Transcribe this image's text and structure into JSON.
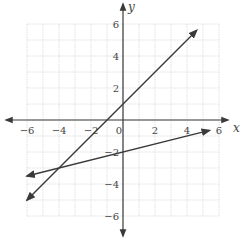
{
  "chart_data": {
    "type": "line",
    "title": "",
    "xlabel": "x",
    "ylabel": "y",
    "xlim": [
      -6,
      6
    ],
    "ylim": [
      -6,
      6
    ],
    "grid": true,
    "x_ticks": [
      -6,
      -4,
      -2,
      0,
      2,
      4,
      6
    ],
    "y_ticks": [
      -6,
      -4,
      -2,
      2,
      4,
      6
    ],
    "x_tick_labels": [
      "−6",
      "−4",
      "−2",
      "0",
      "2",
      "4",
      "6"
    ],
    "y_tick_labels": [
      "−6",
      "−4",
      "−2",
      "2",
      "4",
      "6"
    ],
    "series": [
      {
        "name": "line-1",
        "equation": "y = x + 1",
        "x": [
          -6,
          4.6
        ],
        "y": [
          -5,
          5.6
        ],
        "arrows": "both"
      },
      {
        "name": "line-2",
        "equation": "y = x/4 - 2",
        "x": [
          -6,
          5.4
        ],
        "y": [
          -3.5,
          -0.65
        ],
        "arrows": "both"
      }
    ],
    "intersection": {
      "x": -4,
      "y": -3
    }
  },
  "axes": {
    "x_label": "x",
    "y_label": "y"
  },
  "colors": {
    "line": "#3a3a3a",
    "axis": "#3a3a3a",
    "grid": "#d8d8d8",
    "text": "#444444"
  }
}
